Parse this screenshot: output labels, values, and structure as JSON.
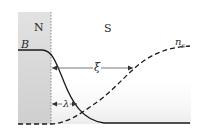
{
  "diagram": {
    "regions": [
      {
        "id": "normal",
        "label": "N",
        "fill": "#d9d9d9"
      },
      {
        "id": "superconductor",
        "label": "S",
        "fill": "#ffffff"
      }
    ],
    "curves": [
      {
        "id": "magnetic-field",
        "label": "B",
        "style": "solid",
        "color": "#1a1a1a"
      },
      {
        "id": "superfluid-density",
        "label_main": "n",
        "label_sub": "s",
        "style": "dashed",
        "color": "#1a1a1a"
      }
    ],
    "length_scales": [
      {
        "id": "coherence-length",
        "label": "ξ"
      },
      {
        "id": "penetration-depth",
        "label": "λ"
      }
    ],
    "interface": {
      "style": "dotted",
      "color": "#888888"
    }
  }
}
